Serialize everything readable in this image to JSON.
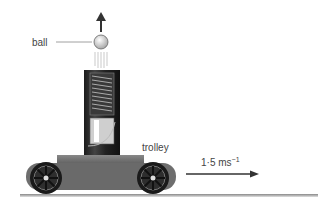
{
  "labels": {
    "ball": "ball",
    "trolley": "trolley",
    "velocity_value": "1·5 ms",
    "velocity_exponent": "−1"
  },
  "colors": {
    "arrow": "#333333",
    "ball_fill": "#d8d8d8",
    "tube": "#2a2a2a",
    "trolley_body": "#6e6e6e",
    "wheel": "#1a1a1a",
    "ground": "#999999",
    "label": "#444444"
  },
  "icons": {
    "up_arrow": "arrow-up-icon",
    "motion_arrow": "arrow-right-icon"
  }
}
